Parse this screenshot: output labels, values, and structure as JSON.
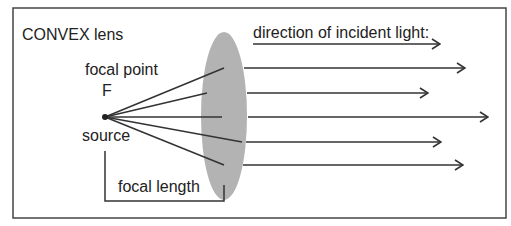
{
  "title": "CONVEX lens",
  "labels": {
    "focal_point": "focal point",
    "focal_point_symbol": "F",
    "source": "source",
    "focal_length": "focal length",
    "incident_light": "direction of incident light:"
  },
  "colors": {
    "lens_fill": "#b3b3b3",
    "line": "#333333",
    "frame": "#444444",
    "text": "#222222"
  }
}
